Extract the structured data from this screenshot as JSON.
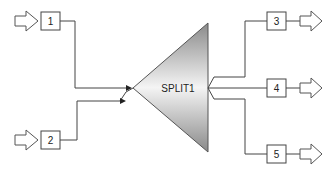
{
  "block": {
    "label": "SPLIT1",
    "type": "splitter"
  },
  "inlets": [
    {
      "id": "1",
      "label": "1"
    },
    {
      "id": "2",
      "label": "2"
    }
  ],
  "outlets": [
    {
      "id": "3",
      "label": "3"
    },
    {
      "id": "4",
      "label": "4"
    },
    {
      "id": "5",
      "label": "5"
    }
  ],
  "colors": {
    "stroke": "#444444",
    "gradient_light": "#f4f4f4",
    "gradient_dark": "#8a8a8a"
  }
}
